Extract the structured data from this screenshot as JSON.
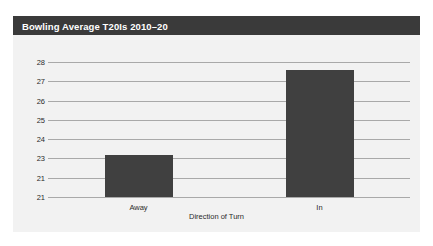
{
  "panel": {
    "title": "Bowling Average T20Is 2010–20",
    "background_color": "#f2f2f2",
    "title_bar_color": "#3a3a3a",
    "title_text_color": "#ffffff"
  },
  "chart_data": {
    "type": "bar",
    "title": "Bowling Average T20Is 2010–20",
    "categories": [
      "Away",
      "In"
    ],
    "values": [
      23.2,
      27.6
    ],
    "xlabel": "Direction of Turn",
    "ylabel": "",
    "ylim": [
      21,
      28
    ],
    "ytick_labels": [
      "28",
      "27",
      "26",
      "25",
      "24",
      "23",
      "21",
      "21"
    ],
    "ytick_values": [
      28,
      27,
      26,
      25,
      24,
      23,
      22,
      21
    ],
    "grid": true,
    "gridline_color": "#a9a9a9",
    "bar_color": "#404040",
    "legend": null
  }
}
